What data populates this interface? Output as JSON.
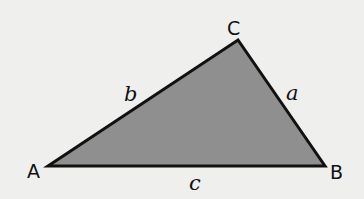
{
  "diagram": {
    "type": "triangle",
    "colors": {
      "background": "#efefee",
      "fill": "#8f8f8f",
      "stroke": "#111111"
    },
    "vertices": [
      {
        "name": "A",
        "label": "A",
        "x": 48,
        "y": 166
      },
      {
        "name": "B",
        "label": "B",
        "x": 325,
        "y": 166
      },
      {
        "name": "C",
        "label": "C",
        "x": 238,
        "y": 40
      }
    ],
    "sides": [
      {
        "name": "a",
        "label": "a",
        "between": "B-C"
      },
      {
        "name": "b",
        "label": "b",
        "between": "A-C"
      },
      {
        "name": "c",
        "label": "c",
        "between": "A-B"
      }
    ]
  }
}
